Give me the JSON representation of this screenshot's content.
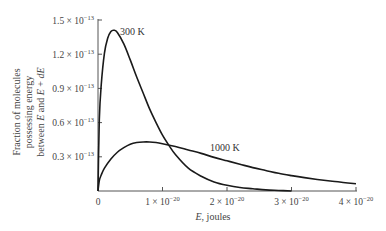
{
  "chart_data": {
    "type": "line",
    "title": "",
    "xlabel": "E, joules",
    "ylabel": [
      "Fraction of molecules",
      "possessing energy",
      "between E and E + dE"
    ],
    "xlim": [
      0,
      4e-20
    ],
    "ylim": [
      0,
      1.5e-13
    ],
    "grid": false,
    "legend": "inline labels",
    "x_ticks": [
      {
        "value": 0,
        "label": "0"
      },
      {
        "value": 1e-20,
        "mant": "1 × 10",
        "exp": "−20"
      },
      {
        "value": 2e-20,
        "mant": "2 × 10",
        "exp": "−20"
      },
      {
        "value": 3e-20,
        "mant": "3 × 10",
        "exp": "−20"
      },
      {
        "value": 4e-20,
        "mant": "4 × 10",
        "exp": "−20"
      }
    ],
    "y_ticks": [
      {
        "value": 3e-14,
        "mant": "0.3 × 10",
        "exp": "−13"
      },
      {
        "value": 6e-14,
        "mant": "0.6 × 10",
        "exp": "−13"
      },
      {
        "value": 9e-14,
        "mant": "0.9 × 10",
        "exp": "−13"
      },
      {
        "value": 1.2e-13,
        "mant": "1.2 × 10",
        "exp": "−13"
      },
      {
        "value": 1.5e-13,
        "mant": "1.5 × 10",
        "exp": "−13"
      }
    ],
    "x_units": "×10^-20 J",
    "y_units": "×10^-13",
    "series": [
      {
        "name": "300 K",
        "label": "300 K",
        "x": [
          0,
          0.02,
          0.05,
          0.1,
          0.15,
          0.2,
          0.25,
          0.3,
          0.4,
          0.5,
          0.6,
          0.7,
          0.8,
          0.9,
          1.0,
          1.1,
          1.2,
          1.4,
          1.6,
          1.8,
          2.0,
          2.2,
          2.4,
          2.6,
          2.8,
          3.0
        ],
        "y": [
          0,
          0.62,
          0.93,
          1.21,
          1.34,
          1.4,
          1.41,
          1.39,
          1.29,
          1.15,
          1.0,
          0.86,
          0.72,
          0.6,
          0.49,
          0.4,
          0.32,
          0.2,
          0.13,
          0.08,
          0.05,
          0.03,
          0.02,
          0.01,
          0.005,
          0.0
        ]
      },
      {
        "name": "1000 K",
        "label": "1000 K",
        "x": [
          0,
          0.02,
          0.05,
          0.1,
          0.2,
          0.3,
          0.4,
          0.5,
          0.6,
          0.7,
          0.8,
          0.9,
          1.0,
          1.2,
          1.4,
          1.6,
          1.8,
          2.0,
          2.2,
          2.4,
          2.6,
          2.8,
          3.0,
          3.2,
          3.4,
          3.6,
          3.8,
          4.0
        ],
        "y": [
          0,
          0.09,
          0.14,
          0.2,
          0.28,
          0.34,
          0.38,
          0.41,
          0.425,
          0.43,
          0.43,
          0.425,
          0.415,
          0.39,
          0.36,
          0.33,
          0.295,
          0.265,
          0.235,
          0.205,
          0.18,
          0.155,
          0.135,
          0.117,
          0.101,
          0.087,
          0.075,
          0.064
        ]
      }
    ]
  },
  "labels": {
    "series_300": "300 K",
    "series_1000": "1000 K",
    "x_title_var": "E",
    "x_title_rest": ", joules",
    "y_title_line1": "Fraction of molecules",
    "y_title_line2": "possessing energy",
    "y_title_line3_pre": "between ",
    "y_title_line3_E": "E",
    "y_title_line3_mid": " and ",
    "y_title_line3_E2": "E",
    "y_title_line3_post": " + ",
    "y_title_line3_dE": "dE",
    "zero": "0"
  },
  "colors": {
    "axis": "#555555",
    "curve": "#1a1a1a",
    "text": "#444444"
  }
}
